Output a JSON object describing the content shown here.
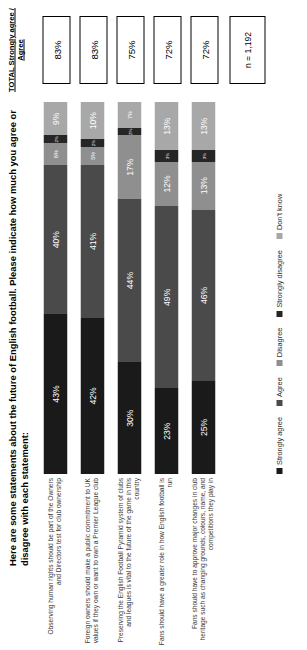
{
  "title": "Here are some statements about the future of English football.  Please indicate how much you agree or disagree with each statement:",
  "total_header": "TOTAL Strongly agree / Agree",
  "sample": "n = 1,192",
  "colors": {
    "strongly_agree": "#1a1a1a",
    "agree": "#4a4a4a",
    "disagree": "#8f8f8f",
    "strongly_disagree": "#262626",
    "dont_know": "#a8a8a8"
  },
  "chart_data": {
    "type": "bar",
    "orientation": "horizontal",
    "stacked": true,
    "title": "Here are some statements about the future of English football.  Please indicate how much you agree or disagree with each statement:",
    "xlabel": "",
    "ylabel": "",
    "xlim": [
      0,
      100
    ],
    "grid": false,
    "legend_position": "bottom",
    "sample_size": "n = 1,192",
    "series": [
      {
        "name": "Strongly agree",
        "values": [
          43,
          42,
          30,
          23,
          25
        ]
      },
      {
        "name": "Agree",
        "values": [
          40,
          41,
          44,
          49,
          46
        ]
      },
      {
        "name": "Disagree",
        "values": [
          6,
          5,
          17,
          12,
          13
        ]
      },
      {
        "name": "Strongly disagree",
        "values": [
          2,
          2,
          2,
          3,
          3
        ]
      },
      {
        "name": "Don't know",
        "values": [
          9,
          10,
          7,
          13,
          13
        ]
      }
    ],
    "categories": [
      "Observing human rights should be part of the Owners and Directors test for club ownership",
      "Foreign owners should make a public commitment to UK values if they own or want to own a Premier League club",
      "Preserving the English Football Pyramid system of clubs and leagues is vital to the future of the game in this country",
      "Fans should have a greater role in how English football is run",
      "Fans should have to approve major changes in club heritage such as changing grounds, colours, name, and competitions they play in"
    ],
    "totals": [
      "83%",
      "83%",
      "75%",
      "72%",
      "72%"
    ]
  },
  "rows": [
    {
      "category": "Observing human rights should be part of the Owners and Directors test for club ownership",
      "total": "83%",
      "segments": [
        {
          "key": "strongly_agree",
          "label": "43%",
          "value": 43
        },
        {
          "key": "agree",
          "label": "40%",
          "value": 40
        },
        {
          "key": "disagree",
          "label": "6%",
          "value": 6
        },
        {
          "key": "strongly_disagree",
          "label": "2%",
          "value": 2
        },
        {
          "key": "dont_know",
          "label": "9%",
          "value": 9
        }
      ]
    },
    {
      "category": "Foreign owners should make a public commitment to UK values if they own or want to own a Premier League club",
      "total": "83%",
      "segments": [
        {
          "key": "strongly_agree",
          "label": "42%",
          "value": 42
        },
        {
          "key": "agree",
          "label": "41%",
          "value": 41
        },
        {
          "key": "disagree",
          "label": "5%",
          "value": 5
        },
        {
          "key": "strongly_disagree",
          "label": "2%",
          "value": 2
        },
        {
          "key": "dont_know",
          "label": "10%",
          "value": 10
        }
      ]
    },
    {
      "category": "Preserving the English Football Pyramid system of clubs and leagues is vital to the future of the game in this country",
      "total": "75%",
      "segments": [
        {
          "key": "strongly_agree",
          "label": "30%",
          "value": 30
        },
        {
          "key": "agree",
          "label": "44%",
          "value": 44
        },
        {
          "key": "disagree",
          "label": "17%",
          "value": 17
        },
        {
          "key": "strongly_disagree",
          "label": "2%",
          "value": 2
        },
        {
          "key": "dont_know",
          "label": "7%",
          "value": 7
        }
      ]
    },
    {
      "category": "Fans should have a greater role in how English football is run",
      "total": "72%",
      "segments": [
        {
          "key": "strongly_agree",
          "label": "23%",
          "value": 23
        },
        {
          "key": "agree",
          "label": "49%",
          "value": 49
        },
        {
          "key": "disagree",
          "label": "12%",
          "value": 12
        },
        {
          "key": "strongly_disagree",
          "label": "3%",
          "value": 3
        },
        {
          "key": "dont_know",
          "label": "13%",
          "value": 13
        }
      ]
    },
    {
      "category": "Fans should have to approve major changes in club heritage such as changing grounds, colours, name, and competitions they play in",
      "total": "72%",
      "segments": [
        {
          "key": "strongly_agree",
          "label": "25%",
          "value": 25
        },
        {
          "key": "agree",
          "label": "46%",
          "value": 46
        },
        {
          "key": "disagree",
          "label": "13%",
          "value": 13
        },
        {
          "key": "strongly_disagree",
          "label": "3%",
          "value": 3
        },
        {
          "key": "dont_know",
          "label": "13%",
          "value": 13
        }
      ]
    }
  ],
  "legend": [
    {
      "label": "Strongly agree",
      "key": "strongly_agree"
    },
    {
      "label": "Agree",
      "key": "agree"
    },
    {
      "label": "Disagree",
      "key": "disagree"
    },
    {
      "label": "Strongly disagree",
      "key": "strongly_disagree"
    },
    {
      "label": "Don't know",
      "key": "dont_know"
    }
  ]
}
